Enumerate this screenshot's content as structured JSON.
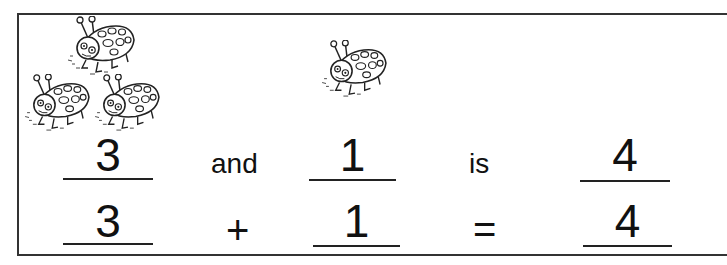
{
  "groups": {
    "first": {
      "count": 3
    },
    "second": {
      "count": 1
    }
  },
  "sentence_row": {
    "first_addend": "3",
    "connector": "and",
    "second_addend": "1",
    "verb": "is",
    "total": "4"
  },
  "equation_row": {
    "first_addend": "3",
    "operator": "+",
    "second_addend": "1",
    "equals": "=",
    "total": "4"
  },
  "icons": {
    "counter": "ladybug-icon"
  }
}
